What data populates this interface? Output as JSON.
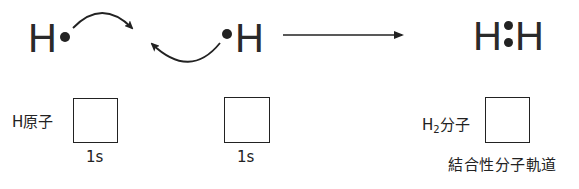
{
  "reaction": {
    "atom_left": {
      "symbol": "H",
      "electron": "•"
    },
    "atom_right": {
      "symbol": "H",
      "electron": "•"
    },
    "product": {
      "left": "H",
      "bond": ":",
      "right": "H"
    },
    "arrow": "reaction-arrow",
    "curved_arrows": [
      "electron-shift-arrow-top",
      "electron-shift-arrow-bottom"
    ]
  },
  "orbitals": {
    "atom1": {
      "label": "H原子",
      "orbital": "1s",
      "electrons": [
        "up"
      ]
    },
    "atom2": {
      "label": "",
      "orbital": "1s",
      "electrons": [
        "up"
      ]
    },
    "molecule": {
      "label_main": "H",
      "label_sub": "2",
      "label_suffix": "分子",
      "orbital": "結合性分子軌道",
      "electrons": [
        "up",
        "down"
      ]
    }
  },
  "colors": {
    "ink": "#222222",
    "background": "#ffffff"
  }
}
